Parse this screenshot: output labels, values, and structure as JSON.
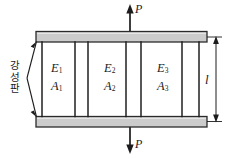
{
  "figure": {
    "colors": {
      "line": "#1c1c1c",
      "plate_fill": "#cccccc",
      "plate_stroke": "#2b2b2b",
      "bar_stroke": "#1f1f1f",
      "background": "#ffffff"
    }
  },
  "annotations": {
    "rigid_plate_label": "강성판",
    "rigid_plate_chars": [
      "강",
      "성",
      "판"
    ],
    "force_top": "P",
    "force_bottom": "P",
    "length_label": "l"
  },
  "bar_groups": [
    {
      "modulus": "E",
      "modulus_sub": "1",
      "area": "A",
      "area_sub": "1"
    },
    {
      "modulus": "E",
      "modulus_sub": "2",
      "area": "A",
      "area_sub": "2"
    },
    {
      "modulus": "E",
      "modulus_sub": "3",
      "area": "A",
      "area_sub": "3"
    }
  ],
  "geometry": {
    "bar_count": 7,
    "plate_count": 2,
    "arrow_count": 2,
    "dimension_lines": 1
  }
}
